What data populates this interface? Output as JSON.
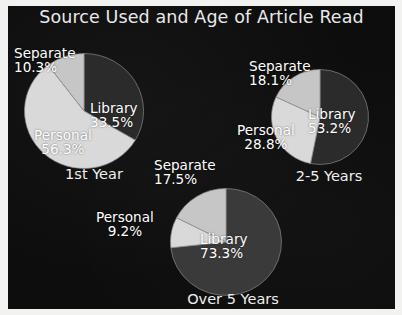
{
  "chart_data": {
    "type": "pie",
    "title": "Source Used and Age of Article Read",
    "legend_position": "none",
    "charts": [
      {
        "name": "1st Year",
        "caption": "1st Year",
        "slices": [
          {
            "label": "Library",
            "value": 33.5,
            "pct_text": "33.5%",
            "color": "#2b2b2b"
          },
          {
            "label": "Personal",
            "value": 56.3,
            "pct_text": "56.3%",
            "color": "#d9d9d9"
          },
          {
            "label": "Separate",
            "value": 10.3,
            "pct_text": "10.3%",
            "color": "#c6c6c6"
          }
        ]
      },
      {
        "name": "2-5 Years",
        "caption": "2-5 Years",
        "slices": [
          {
            "label": "Library",
            "value": 53.2,
            "pct_text": "53.2%",
            "color": "#2b2b2b"
          },
          {
            "label": "Personal",
            "value": 28.8,
            "pct_text": "28.8%",
            "color": "#d9d9d9"
          },
          {
            "label": "Separate",
            "value": 18.1,
            "pct_text": "18.1%",
            "color": "#c6c6c6"
          }
        ]
      },
      {
        "name": "Over 5 Years",
        "caption": "Over 5 Years",
        "slices": [
          {
            "label": "Library",
            "value": 73.3,
            "pct_text": "73.3%",
            "color": "#3a3a3a"
          },
          {
            "label": "Personal",
            "value": 9.2,
            "pct_text": "9.2%",
            "color": "#d9d9d9"
          },
          {
            "label": "Separate",
            "value": 17.5,
            "pct_text": "17.5%",
            "color": "#c6c6c6"
          }
        ]
      }
    ],
    "categories": [
      "Library",
      "Personal",
      "Separate"
    ],
    "series": [
      {
        "name": "1st Year",
        "values": [
          33.5,
          56.3,
          10.3
        ]
      },
      {
        "name": "2-5 Years",
        "values": [
          53.2,
          28.8,
          18.1
        ]
      },
      {
        "name": "Over 5 Years",
        "values": [
          73.3,
          9.2,
          17.5
        ]
      }
    ],
    "colors": {
      "background": "#0d0d0d",
      "frame": "#f2f2f0",
      "text": "#ffffff",
      "library": "#2b2b2b",
      "personal": "#d9d9d9",
      "separate": "#c6c6c6",
      "slice_outline": "#8a8a8a"
    }
  }
}
